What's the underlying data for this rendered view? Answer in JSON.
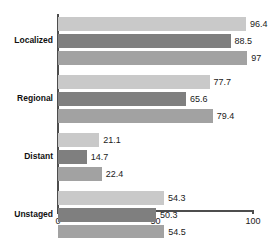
{
  "chart_data": {
    "type": "bar",
    "orientation": "horizontal",
    "title": "",
    "xlabel": "",
    "ylabel": "",
    "xlim": [
      0,
      100
    ],
    "xticks": [
      "0",
      "50",
      "100"
    ],
    "xtick_values": [
      0,
      50,
      100
    ],
    "grid": false,
    "legend": "none",
    "categories": [
      "Localized",
      "Regional",
      "Distant",
      "Unstaged"
    ],
    "series": [
      {
        "name": "series-1",
        "color": "#c9c9c9",
        "values": [
          96.4,
          77.7,
          21.1,
          54.3
        ],
        "labels": [
          "96.4",
          "77.7",
          "21.1",
          "54.3"
        ]
      },
      {
        "name": "series-2",
        "color": "#7f7f7f",
        "values": [
          88.5,
          65.6,
          14.7,
          50.3
        ],
        "labels": [
          "88.5",
          "65.6",
          "14.7",
          "50.3"
        ]
      },
      {
        "name": "series-3",
        "color": "#a2a2a2",
        "values": [
          97,
          79.4,
          22.4,
          54.5
        ],
        "labels": [
          "97",
          "79.4",
          "22.4",
          "54.5"
        ]
      }
    ],
    "axis_color": "#4d4d4d"
  }
}
